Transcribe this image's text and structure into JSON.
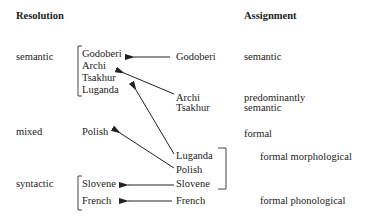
{
  "headers": {
    "resolution": "Resolution",
    "assignment": "Assignment"
  },
  "resolution_types": {
    "semantic": "semantic",
    "mixed": "mixed",
    "syntactic": "syntactic"
  },
  "resolution_languages": {
    "semantic_group": [
      "Godoberi",
      "Archi",
      "Tsakhur",
      "Luganda"
    ],
    "mixed_group": [
      "Polish"
    ],
    "syntactic_group": [
      "Slovene",
      "French"
    ]
  },
  "assignment_languages": {
    "godoberi": "Godoberi",
    "archi_tsakhur": [
      "Archi",
      "Tsakhur"
    ],
    "formal_morphological_group": [
      "Luganda",
      "Polish",
      "Slovene"
    ],
    "french": "French"
  },
  "assignment_types": {
    "semantic": "semantic",
    "predominantly_semantic": [
      "predominantly",
      "semantic"
    ],
    "formal": "formal",
    "formal_morphological": "formal morphological",
    "formal_phonological": "formal phonological"
  },
  "arrows": [
    {
      "from": "Godoberi (assignment)",
      "to": "Godoberi (resolution)"
    },
    {
      "from": "Archi/Tsakhur (assignment)",
      "to": "Tsakhur (resolution)"
    },
    {
      "from": "Luganda (assignment)",
      "to": "Luganda (resolution)"
    },
    {
      "from": "Polish (assignment)",
      "to": "Polish (resolution)"
    },
    {
      "from": "Slovene (assignment)",
      "to": "Slovene (resolution)"
    },
    {
      "from": "French (assignment)",
      "to": "French (resolution)"
    }
  ]
}
